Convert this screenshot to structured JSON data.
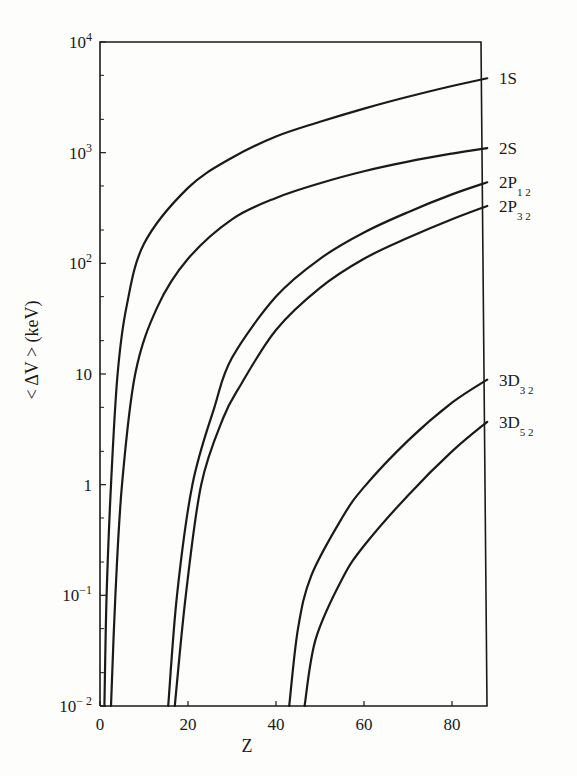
{
  "chart_data": {
    "type": "line",
    "title": "",
    "xlabel": "Z",
    "ylabel": "< ΔV > (keV)",
    "yscale": "log",
    "xlim": [
      0,
      88
    ],
    "ylim": [
      0.01,
      10000
    ],
    "x_ticks": [
      "0",
      "20",
      "40",
      "60",
      "80"
    ],
    "y_ticks": [
      {
        "base": "10",
        "exp": "4",
        "value": 10000
      },
      {
        "base": "10",
        "exp": "3",
        "value": 1000
      },
      {
        "base": "10",
        "exp": "2",
        "value": 100
      },
      {
        "base": "10",
        "exp": "",
        "value": 10
      },
      {
        "base": "1",
        "exp": "",
        "value": 1
      },
      {
        "base": "10",
        "exp": "−1",
        "value": 0.1
      },
      {
        "base": "10",
        "exp": "− 2",
        "value": 0.01
      }
    ],
    "grid": false,
    "legend": "inline labels at right edge",
    "series": [
      {
        "name": "1S",
        "label_main": "1S",
        "label_sub": "",
        "points": [
          [
            1,
            0.01
          ],
          [
            1.5,
            0.1
          ],
          [
            2.5,
            1
          ],
          [
            4,
            10
          ],
          [
            6,
            40
          ],
          [
            10,
            150
          ],
          [
            20,
            480
          ],
          [
            30,
            900
          ],
          [
            40,
            1400
          ],
          [
            50,
            1900
          ],
          [
            60,
            2500
          ],
          [
            70,
            3200
          ],
          [
            80,
            4000
          ],
          [
            88,
            4700
          ]
        ]
      },
      {
        "name": "2S",
        "label_main": "2S",
        "label_sub": "",
        "points": [
          [
            2.5,
            0.01
          ],
          [
            3.5,
            0.1
          ],
          [
            5,
            1
          ],
          [
            8,
            10
          ],
          [
            13,
            40
          ],
          [
            20,
            110
          ],
          [
            30,
            250
          ],
          [
            40,
            390
          ],
          [
            50,
            530
          ],
          [
            60,
            680
          ],
          [
            70,
            830
          ],
          [
            80,
            980
          ],
          [
            88,
            1100
          ]
        ]
      },
      {
        "name": "2P1/2",
        "label_main": "2P",
        "label_sub": "1 2",
        "points": [
          [
            15.5,
            0.01
          ],
          [
            17.5,
            0.1
          ],
          [
            21,
            1
          ],
          [
            26,
            5
          ],
          [
            30,
            14
          ],
          [
            40,
            50
          ],
          [
            50,
            110
          ],
          [
            60,
            190
          ],
          [
            70,
            290
          ],
          [
            80,
            420
          ],
          [
            88,
            540
          ]
        ]
      },
      {
        "name": "2P3/2",
        "label_main": "2P",
        "label_sub": "3 2",
        "points": [
          [
            17,
            0.01
          ],
          [
            19.5,
            0.1
          ],
          [
            23,
            1
          ],
          [
            28,
            4
          ],
          [
            32,
            8
          ],
          [
            40,
            25
          ],
          [
            50,
            60
          ],
          [
            60,
            110
          ],
          [
            70,
            170
          ],
          [
            80,
            250
          ],
          [
            88,
            330
          ]
        ]
      },
      {
        "name": "3D3/2",
        "label_main": "3D",
        "label_sub": "3 2",
        "points": [
          [
            43,
            0.01
          ],
          [
            45,
            0.05
          ],
          [
            48,
            0.15
          ],
          [
            55,
            0.5
          ],
          [
            60,
            0.95
          ],
          [
            70,
            2.5
          ],
          [
            80,
            5.5
          ],
          [
            88,
            8.9
          ]
        ]
      },
      {
        "name": "3D5/2",
        "label_main": "3D",
        "label_sub": "5 2",
        "points": [
          [
            46.5,
            0.01
          ],
          [
            49,
            0.04
          ],
          [
            55,
            0.14
          ],
          [
            60,
            0.28
          ],
          [
            70,
            0.8
          ],
          [
            80,
            2
          ],
          [
            88,
            3.7
          ]
        ]
      }
    ]
  },
  "colors": {
    "ink": "#1a1a1a",
    "paper": "#fdfdfb"
  }
}
